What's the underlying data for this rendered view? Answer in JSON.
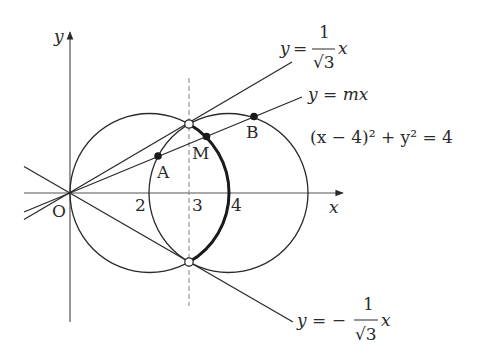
{
  "diagram": {
    "type": "coordinate-geometry-figure",
    "colors": {
      "stroke": "#2a2a2a",
      "dashed": "#8a8a8a",
      "background": "#ffffff"
    },
    "axes": {
      "x_label": "x",
      "y_label": "y",
      "origin_label": "O",
      "x_ticks": [
        "2",
        "3",
        "4"
      ]
    },
    "points": {
      "A": "A",
      "B": "B",
      "M": "M"
    },
    "equations": {
      "line_upper": {
        "lhs": "y =",
        "num": "1",
        "den": "√3",
        "var": "x"
      },
      "line_m": "y = mx",
      "circle": "(x − 4)² + y² = 4",
      "line_lower": {
        "lhs": "y = −",
        "num": "1",
        "den": "√3",
        "var": "x"
      }
    },
    "circles": [
      {
        "name": "circle-center-2",
        "cx": 2,
        "cy": 0,
        "r": 2
      },
      {
        "name": "circle-center-4",
        "cx": 4,
        "cy": 0,
        "r": 2
      }
    ],
    "dashed_line": "x = 3",
    "open_points": [
      "(3, √3)",
      "(3, −√3)"
    ],
    "highlighted_arc": "arc of circle (x−2)²+y²=4 from (3,√3) to (3,−√3) through (4,0)"
  }
}
